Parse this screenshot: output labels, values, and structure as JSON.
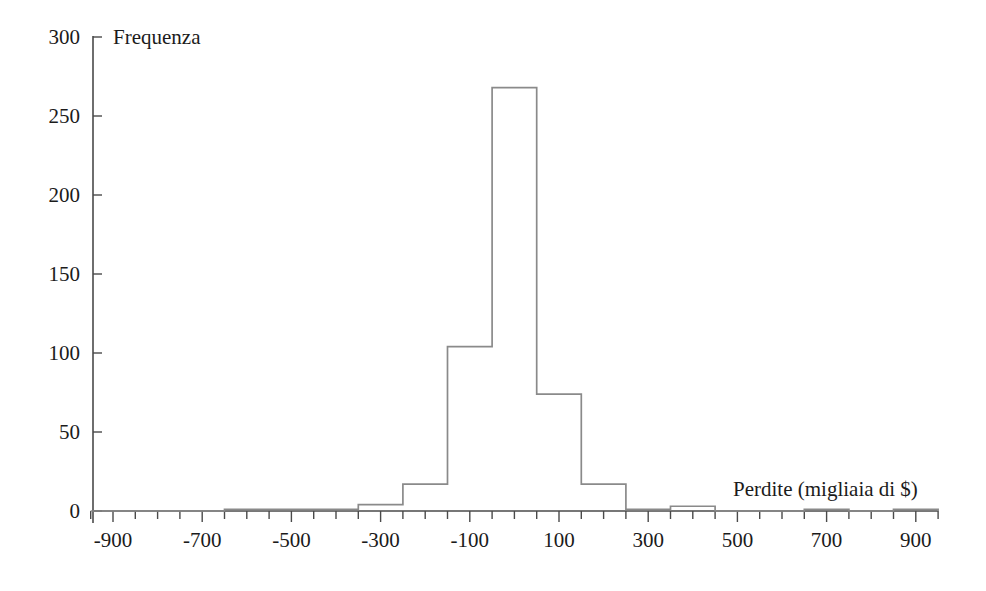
{
  "chart_data": {
    "type": "bar",
    "title": "",
    "subtitle": "",
    "xlabel": "Perdite (migliaia di $)",
    "ylabel": "Frequenza",
    "xlim": [
      -950,
      950
    ],
    "ylim": [
      0,
      300
    ],
    "grid": false,
    "legend": "none",
    "bin_width": 100,
    "x_tick_labels": [
      "-900",
      "-700",
      "-500",
      "-300",
      "-100",
      "100",
      "300",
      "500",
      "700",
      "900"
    ],
    "x_tick_values": [
      -900,
      -700,
      -500,
      -300,
      -100,
      100,
      300,
      500,
      700,
      900
    ],
    "x_minor_tick_step": 50,
    "y_tick_labels": [
      "0",
      "50",
      "100",
      "150",
      "200",
      "250",
      "300"
    ],
    "y_tick_values": [
      0,
      50,
      100,
      150,
      200,
      250,
      300
    ],
    "bin_starts": [
      -950,
      -850,
      -750,
      -650,
      -550,
      -450,
      -350,
      -250,
      -150,
      -50,
      50,
      150,
      250,
      350,
      450,
      550,
      650,
      750,
      850
    ],
    "bin_ends": [
      -850,
      -750,
      -650,
      -550,
      -450,
      -350,
      -250,
      -150,
      -50,
      50,
      150,
      250,
      350,
      450,
      550,
      650,
      750,
      850,
      950
    ],
    "categories": [
      "-950 to -850",
      "-850 to -750",
      "-750 to -650",
      "-650 to -550",
      "-550 to -450",
      "-450 to -350",
      "-350 to -250",
      "-250 to -150",
      "-150 to -50",
      "-50 to 50",
      "50 to 150",
      "150 to 250",
      "250 to 350",
      "350 to 450",
      "450 to 550",
      "550 to 650",
      "650 to 750",
      "750 to 850",
      "850 to 950"
    ],
    "values": [
      0,
      0,
      0,
      1,
      1,
      1,
      4,
      17,
      104,
      268,
      74,
      17,
      1,
      3,
      0,
      0,
      1,
      0,
      1
    ],
    "colors": {
      "bar_stroke": "#8a8a8a",
      "bar_fill": "none",
      "axis": "#4a4a4a",
      "text": "#1b1b1b",
      "background": "#ffffff"
    }
  }
}
